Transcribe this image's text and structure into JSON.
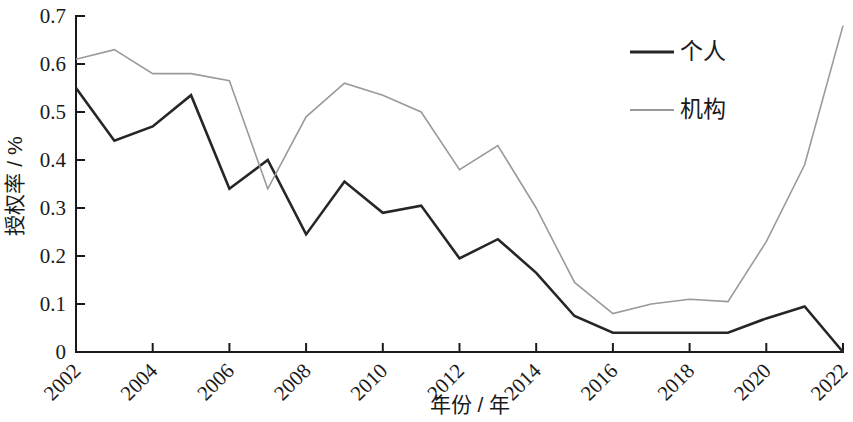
{
  "chart_data": {
    "type": "line",
    "title": "",
    "subtitle": "",
    "xlabel": "年份 / 年",
    "ylabel": "授权率 / %",
    "x": [
      2002,
      2003,
      2004,
      2005,
      2006,
      2007,
      2008,
      2009,
      2010,
      2011,
      2012,
      2013,
      2014,
      2015,
      2016,
      2017,
      2018,
      2019,
      2020,
      2021,
      2022
    ],
    "xtick_labels": [
      "2002",
      "2004",
      "2006",
      "2008",
      "2010",
      "2012",
      "2014",
      "2016",
      "2018",
      "2020",
      "2022"
    ],
    "xtick_values": [
      2002,
      2004,
      2006,
      2008,
      2010,
      2012,
      2014,
      2016,
      2018,
      2020,
      2022
    ],
    "ytick_labels": [
      "0",
      "0.1",
      "0.2",
      "0.3",
      "0.4",
      "0.5",
      "0.6",
      "0.7"
    ],
    "ytick_values": [
      0,
      0.1,
      0.2,
      0.3,
      0.4,
      0.5,
      0.6,
      0.7
    ],
    "xlim": [
      2002,
      2022
    ],
    "ylim": [
      0,
      0.7
    ],
    "grid": false,
    "legend_position": "top-right",
    "series": [
      {
        "name": "个人",
        "color": "#262626",
        "width": 2.6,
        "values": [
          0.55,
          0.44,
          0.47,
          0.535,
          0.34,
          0.4,
          0.245,
          0.355,
          0.29,
          0.305,
          0.195,
          0.235,
          0.165,
          0.075,
          0.04,
          0.04,
          0.04,
          0.04,
          0.07,
          0.095,
          0.0
        ]
      },
      {
        "name": "机构",
        "color": "#9a9a9a",
        "width": 1.6,
        "values": [
          0.61,
          0.63,
          0.58,
          0.58,
          0.565,
          0.34,
          0.49,
          0.56,
          0.535,
          0.5,
          0.38,
          0.43,
          0.3,
          0.145,
          0.08,
          0.1,
          0.11,
          0.105,
          0.23,
          0.39,
          0.68
        ]
      }
    ],
    "legend": [
      {
        "label": "个人",
        "color": "#262626",
        "width": 3.0
      },
      {
        "label": "机构",
        "color": "#9a9a9a",
        "width": 1.8
      }
    ]
  }
}
